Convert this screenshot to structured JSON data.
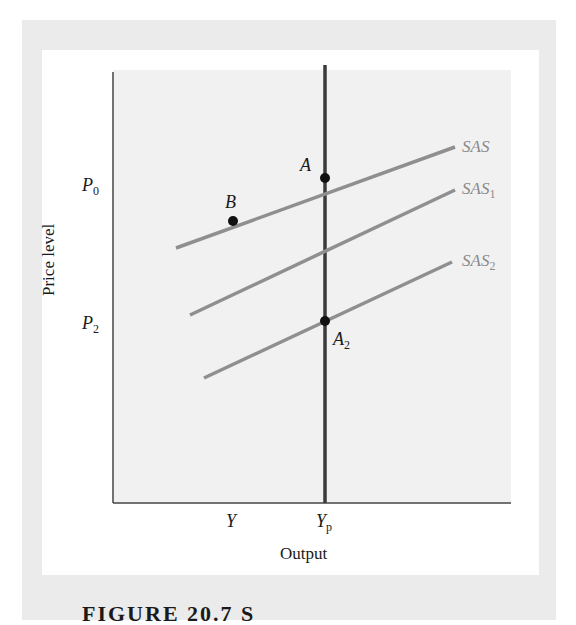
{
  "diagram": {
    "type": "economics-graph",
    "x_axis": {
      "title": "Output",
      "ticks": [
        {
          "label": "Y",
          "sub": ""
        },
        {
          "label": "Y",
          "sub": "p"
        }
      ]
    },
    "y_axis": {
      "title": "Price level",
      "ticks": [
        {
          "label": "P",
          "sub": "0"
        },
        {
          "label": "P",
          "sub": "2"
        }
      ]
    },
    "curves": [
      {
        "name": "SAS",
        "label": "SAS",
        "sub": "",
        "color": "#8f8f8f"
      },
      {
        "name": "SAS1",
        "label": "SAS",
        "sub": "1",
        "color": "#8f8f8f"
      },
      {
        "name": "SAS2",
        "label": "SAS",
        "sub": "2",
        "color": "#8f8f8f"
      },
      {
        "name": "potential-output",
        "label": "",
        "color": "#3a3a3a"
      }
    ],
    "points": [
      {
        "name": "A",
        "label": "A",
        "sub": ""
      },
      {
        "name": "B",
        "label": "B",
        "sub": ""
      },
      {
        "name": "A2",
        "label": "A",
        "sub": "2"
      }
    ],
    "caption": "FIGURE 20.7  S"
  },
  "colors": {
    "panel": "#ebebeb",
    "plot_bg": "#f1f1f1",
    "curve": "#8f8f8f",
    "vertical_line": "#3a3a3a",
    "axis": "#444444",
    "point": "#111111"
  }
}
